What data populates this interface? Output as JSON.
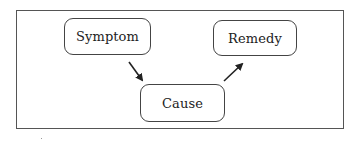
{
  "diagram": {
    "type": "flow",
    "nodes": [
      {
        "id": "symptom",
        "label": "Symptom"
      },
      {
        "id": "cause",
        "label": "Cause"
      },
      {
        "id": "remedy",
        "label": "Remedy"
      }
    ],
    "edges": [
      {
        "from": "symptom",
        "to": "cause"
      },
      {
        "from": "cause",
        "to": "remedy"
      }
    ],
    "colors": {
      "stroke": "#444444",
      "text": "#222222",
      "background": "#ffffff"
    }
  }
}
